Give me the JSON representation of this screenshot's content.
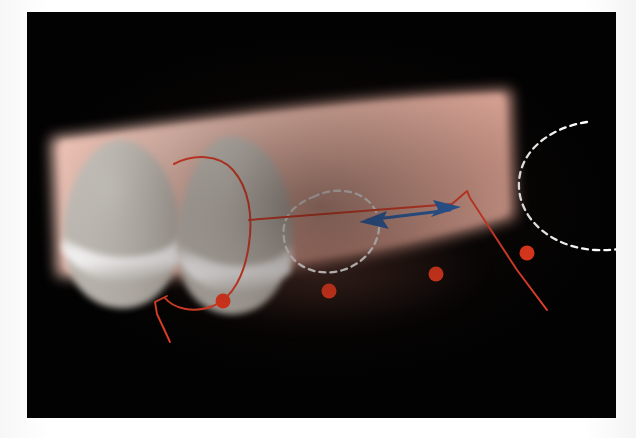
{
  "figure": {
    "kind": "clinical-intraoral-photograph",
    "modality": "intraoral photograph of a partially edentulous posterior ridge",
    "plate_background_color": "#020202",
    "page_background_color": "#ffffff",
    "caption_partial": "",
    "tissue": {
      "label": "alveolar ridge mucosa",
      "color_light": "#f0c3b5",
      "color_mid": "#e7b0a1",
      "color_shadow": "#c99283"
    },
    "teeth": [
      {
        "label": "tooth-crown-distal",
        "enamel_color": "#cfcbc4",
        "highlight_color": "#ffffff"
      },
      {
        "label": "tooth-crown-mesial",
        "enamel_color": "#cfcbc4",
        "highlight_color": "#ffffff"
      }
    ],
    "annotations": {
      "outline": {
        "label": "red tooth outline",
        "color": "#e8402a",
        "stroke_width": "1.6"
      },
      "reference_line": {
        "label": "red occlusal reference line",
        "color": "#e8402a",
        "stroke_width": "1.6"
      },
      "span_arrow": {
        "label": "edentulous span double arrow",
        "color": "#2b68b8",
        "head_count": "2",
        "stroke_width": "2.6"
      },
      "ghost_circles": {
        "label": "white dashed missing-tooth outlines",
        "color": "#ffffff",
        "dash": "6 5",
        "count": "2"
      },
      "markers": {
        "label": "red mucogingival markers",
        "color": "#f03a1e",
        "count": "4",
        "radius": "7"
      }
    }
  }
}
